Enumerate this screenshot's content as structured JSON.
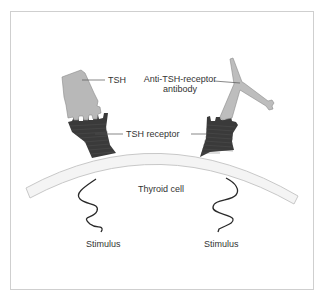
{
  "diagram": {
    "labels": {
      "tsh": "TSH",
      "antibody_line1": "Anti-TSH-receptor",
      "antibody_line2": "antibody",
      "receptor": "TSH receptor",
      "cell": "Thyroid cell",
      "stimulus_left": "Stimulus",
      "stimulus_right": "Stimulus"
    },
    "colors": {
      "receptor": "#3a3a3a",
      "tsh": "#b8b8b8",
      "antibody": "#bdbdbd",
      "membrane_fill": "#f4f4f4",
      "membrane_stroke": "#cccccc",
      "frame": "#cfcfcf",
      "text": "#333333"
    }
  }
}
